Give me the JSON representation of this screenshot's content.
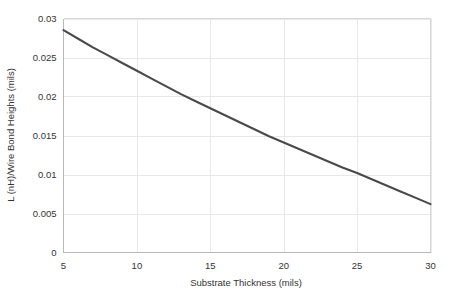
{
  "chart_data": {
    "type": "line",
    "title": "",
    "subtitle": "",
    "xlabel": "Substrate Thickness (mils)",
    "ylabel": "L (nH)/Wire Bond Heights (mils)",
    "xlim": [
      5,
      30
    ],
    "ylim": [
      0,
      0.03
    ],
    "xticks": [
      5,
      10,
      15,
      20,
      25,
      30
    ],
    "xtick_labels": [
      "5",
      "10",
      "15",
      "20",
      "25",
      "30"
    ],
    "yticks": [
      0,
      0.005,
      0.01,
      0.015,
      0.02,
      0.025,
      0.03
    ],
    "ytick_labels": [
      "0",
      "0.005",
      "0.01",
      "0.015",
      "0.02",
      "0.025",
      "0.03"
    ],
    "grid": true,
    "grid_color": "#e8e8e8",
    "legend": null,
    "legend_position": "none",
    "series": [
      {
        "name": "Inductance per wire bond height",
        "color": "#4a4a4a",
        "x": [
          5,
          6,
          7,
          8,
          9,
          10,
          11,
          12,
          13,
          14,
          15,
          16,
          17,
          18,
          19,
          20,
          21,
          22,
          23,
          24,
          25,
          26,
          27,
          28,
          29,
          30
        ],
        "y": [
          0.0285,
          0.0274,
          0.0263,
          0.0253,
          0.0243,
          0.0233,
          0.0223,
          0.0213,
          0.0203,
          0.0194,
          0.0185,
          0.0176,
          0.0167,
          0.0158,
          0.0149,
          0.0141,
          0.0133,
          0.0125,
          0.0117,
          0.0109,
          0.0102,
          0.0094,
          0.0086,
          0.0078,
          0.007,
          0.0062
        ]
      }
    ],
    "annotations": []
  },
  "axes": {
    "x_axis_name": "substrate-thickness-axis",
    "y_axis_name": "inductance-axis"
  }
}
